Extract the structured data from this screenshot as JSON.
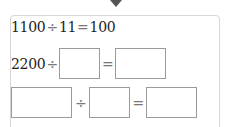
{
  "arrow": {
    "icon": "down-arrow-icon"
  },
  "equations": [
    {
      "dividend": "1100",
      "divide_sign": "÷",
      "divisor": "11",
      "equals_sign": "=",
      "quotient": "100"
    },
    {
      "dividend": "2200",
      "divide_sign": "÷",
      "divisor": "",
      "equals_sign": "=",
      "quotient": ""
    },
    {
      "dividend": "",
      "divide_sign": "÷",
      "divisor": "",
      "equals_sign": "=",
      "quotient": ""
    }
  ]
}
